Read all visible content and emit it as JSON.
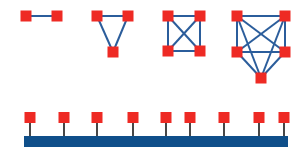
{
  "colors": {
    "node": "#ee2a24",
    "mesh_edge": "#2b5d9b",
    "bus_bar": "#0f4f8a",
    "drop_line": "#1a1a1a",
    "background": "#ffffff"
  },
  "node_size": 11,
  "meshes": [
    {
      "name": "mesh-2-nodes",
      "nodes": [
        [
          26,
          16
        ],
        [
          57,
          16
        ]
      ],
      "edges": [
        [
          0,
          1
        ]
      ]
    },
    {
      "name": "mesh-3-nodes",
      "nodes": [
        [
          97,
          16
        ],
        [
          128,
          16
        ],
        [
          113,
          52
        ]
      ],
      "edges": [
        [
          0,
          1
        ],
        [
          0,
          2
        ],
        [
          1,
          2
        ]
      ]
    },
    {
      "name": "mesh-4-nodes",
      "nodes": [
        [
          168,
          16
        ],
        [
          200,
          16
        ],
        [
          168,
          51
        ],
        [
          200,
          51
        ]
      ],
      "edges": [
        [
          0,
          1
        ],
        [
          0,
          2
        ],
        [
          0,
          3
        ],
        [
          1,
          2
        ],
        [
          1,
          3
        ],
        [
          2,
          3
        ]
      ]
    },
    {
      "name": "mesh-5-nodes",
      "nodes": [
        [
          237,
          16
        ],
        [
          285,
          16
        ],
        [
          237,
          52
        ],
        [
          285,
          52
        ],
        [
          261,
          78
        ]
      ],
      "edges": [
        [
          0,
          1
        ],
        [
          0,
          2
        ],
        [
          0,
          3
        ],
        [
          0,
          4
        ],
        [
          1,
          2
        ],
        [
          1,
          3
        ],
        [
          1,
          4
        ],
        [
          2,
          3
        ],
        [
          2,
          4
        ],
        [
          3,
          4
        ]
      ]
    }
  ],
  "bus": {
    "bar": {
      "x": 24,
      "y": 136,
      "width": 264,
      "height": 11
    },
    "node_top_y": 112,
    "nodes_x": [
      30,
      64,
      97,
      133,
      166,
      190,
      224,
      259,
      284
    ]
  }
}
